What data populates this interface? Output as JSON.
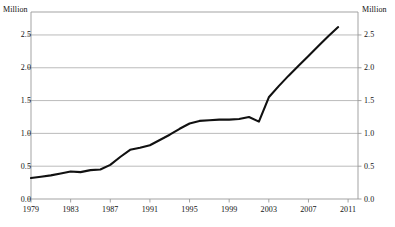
{
  "chart_data": {
    "type": "line",
    "title": "",
    "xlabel": "",
    "ylabel": "Million",
    "y2label": "Million",
    "grid": true,
    "legend": "none",
    "xlim": [
      1979,
      2012
    ],
    "ylim": [
      0.0,
      2.85
    ],
    "xticks": [
      1979,
      1983,
      1987,
      1991,
      1995,
      1999,
      2003,
      2007,
      2011
    ],
    "yticks": [
      "0.0",
      "0.5",
      "1.0",
      "1.5",
      "2.0",
      "2.5"
    ],
    "ytick_values": [
      0.0,
      0.5,
      1.0,
      1.5,
      2.0,
      2.5
    ],
    "x": [
      1979,
      1980,
      1981,
      1982,
      1983,
      1984,
      1985,
      1986,
      1987,
      1988,
      1989,
      1990,
      1991,
      1992,
      1993,
      1994,
      1995,
      1996,
      1997,
      1998,
      1999,
      2000,
      2001,
      2002,
      2003,
      2004,
      2005,
      2006,
      2007,
      2008,
      2009,
      2010
    ],
    "values": [
      0.32,
      0.34,
      0.36,
      0.39,
      0.42,
      0.41,
      0.44,
      0.45,
      0.52,
      0.64,
      0.75,
      0.78,
      0.82,
      0.9,
      0.98,
      1.07,
      1.15,
      1.19,
      1.2,
      1.21,
      1.21,
      1.22,
      1.25,
      1.18,
      1.55,
      1.72,
      1.88,
      2.03,
      2.18,
      2.33,
      2.48,
      2.62
    ],
    "series": [
      {
        "name": "Million",
        "color": "#111111",
        "values": [
          0.32,
          0.34,
          0.36,
          0.39,
          0.42,
          0.41,
          0.44,
          0.45,
          0.52,
          0.64,
          0.75,
          0.78,
          0.82,
          0.9,
          0.98,
          1.07,
          1.15,
          1.19,
          1.2,
          1.21,
          1.21,
          1.22,
          1.25,
          1.18,
          1.55,
          1.72,
          1.88,
          2.03,
          2.18,
          2.33,
          2.48,
          2.62
        ]
      }
    ]
  },
  "axes": {
    "unit_left": "Million",
    "unit_right": "Million"
  },
  "colors": {
    "line": "#111111",
    "grid": "#aaaaaa",
    "frame": "#999999",
    "background": "#ffffff",
    "text": "#111111"
  }
}
